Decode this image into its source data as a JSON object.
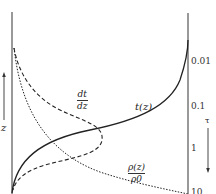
{
  "diagram": {
    "left_axis": {
      "label": "z",
      "arrow_direction": "up"
    },
    "right_axis": {
      "label": "τ",
      "arrow_direction": "down",
      "ticks": [
        {
          "label": "0.01",
          "y": 62
        },
        {
          "label": "0.1",
          "y": 107
        },
        {
          "label": "1",
          "y": 149
        },
        {
          "label": "10",
          "y": 192
        }
      ]
    },
    "curves": [
      {
        "id": "t-z",
        "label": "t(z)",
        "style": "solid"
      },
      {
        "id": "dt-dz",
        "label_num": "dt",
        "label_den": "dz",
        "style": "dashed"
      },
      {
        "id": "rho-z",
        "label_num": "ρ(z)",
        "label_den": "ρ0",
        "style": "dotted"
      }
    ],
    "colors": {
      "line": "#222222",
      "axis": "#555555"
    }
  }
}
